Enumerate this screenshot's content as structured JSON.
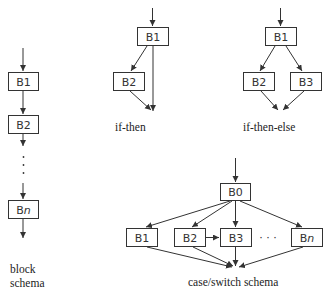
{
  "diagrams": {
    "block": {
      "caption_line1": "block",
      "caption_line2": "schema",
      "boxes": [
        "B1",
        "B2",
        "Bn"
      ],
      "ellipsis": "⋮"
    },
    "if_then": {
      "caption": "if-then",
      "boxes": [
        "B1",
        "B2"
      ]
    },
    "if_then_else": {
      "caption": "if-then-else",
      "boxes": [
        "B1",
        "B2",
        "B3"
      ]
    },
    "case_switch": {
      "caption": "case/switch schema",
      "boxes": [
        "B0",
        "B1",
        "B2",
        "B3",
        "Bn"
      ],
      "ellipsis": "· · ·"
    }
  },
  "colors": {
    "stroke": "#333333",
    "background": "#ffffff"
  }
}
